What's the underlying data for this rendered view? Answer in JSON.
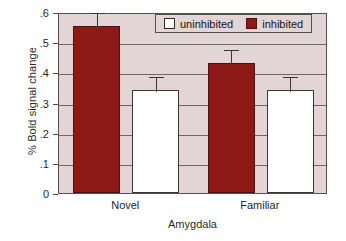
{
  "chart_data": {
    "type": "bar",
    "title": "",
    "subtitle": "",
    "xlabel": "Amygdala",
    "ylabel": "% Bold signal change",
    "categories": [
      "Novel",
      "Familiar"
    ],
    "series": [
      {
        "name": "inhibited",
        "color": "#8E1A17",
        "values": [
          0.555,
          0.43
        ],
        "errors": [
          0.05,
          0.05
        ]
      },
      {
        "name": "uninhibited",
        "color": "#FFFFFF",
        "values": [
          0.34,
          0.34
        ],
        "errors": [
          0.05,
          0.05
        ]
      }
    ],
    "ylim": [
      0,
      0.6
    ],
    "yticks": [
      0,
      0.1,
      0.2,
      0.3,
      0.4,
      0.5,
      0.6
    ],
    "ytick_labels": [
      "0",
      ".1",
      ".2",
      ".3",
      ".4",
      ".5",
      ".6"
    ],
    "grid": true,
    "grid_axis": "y",
    "legend_position": "top-right-inside",
    "plot_background": "#E3D5D5",
    "figure_background": "#FFFFFF",
    "axis_color": "#55504F"
  },
  "legend": {
    "entries": [
      {
        "label": "uninhibited",
        "swatch": "white-square-swatch"
      },
      {
        "label": "inhibited",
        "swatch": "dark-red-square-swatch"
      }
    ]
  },
  "axes": {
    "y_title": "% Bold signal change",
    "x_title": "Amygdala",
    "y_tick_labels": [
      "0",
      ".1",
      ".2",
      ".3",
      ".4",
      ".5",
      ".6"
    ],
    "x_tick_labels": [
      "Novel",
      "Familiar"
    ]
  }
}
